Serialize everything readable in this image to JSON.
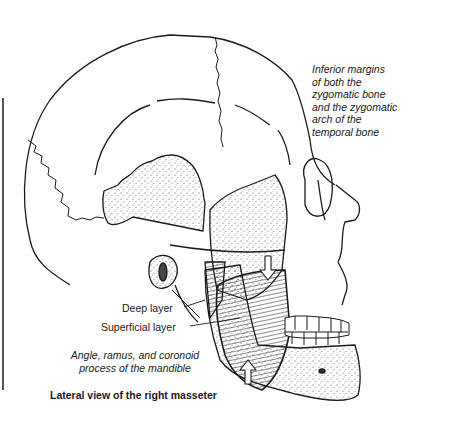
{
  "figure": {
    "title": "Lateral view of the right masseter",
    "labels": {
      "origin": [
        "Inferior margins",
        "of both the",
        "zygomatic bone",
        "and the zygomatic",
        "arch of the",
        "temporal bone"
      ],
      "deep_layer": "Deep layer",
      "superficial_layer": "Superficial layer",
      "insertion": [
        "Angle, ramus, and coronoid",
        "process of the mandible"
      ]
    },
    "colors": {
      "line": "#1a1a1a",
      "stipple": "#555555",
      "background": "#ffffff"
    }
  }
}
